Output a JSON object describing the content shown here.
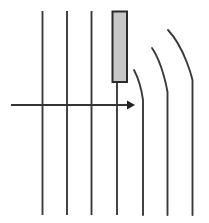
{
  "figure": {
    "title": "",
    "background_color": "#ffffff",
    "width": 209,
    "height": 223
  },
  "colors": {
    "line_stroke": "#3a3a3a",
    "curve_stroke": "#3a3a3a",
    "arrow_stroke": "#333333",
    "arrow_head_fill": "#222222",
    "slab_fill": "#c8c8c8",
    "slab_stroke": "#2b2b2b"
  },
  "chart_data": {
    "type": "line",
    "title": "",
    "xlabel": "",
    "ylabel": "",
    "grid": false,
    "legend": "none",
    "xlim": [
      0,
      209
    ],
    "ylim": [
      0,
      223
    ],
    "series": [
      {
        "name": "straight-line-1",
        "kind": "straight-vertical",
        "x": [
          42.5,
          42.5
        ],
        "y": [
          11,
          215
        ]
      },
      {
        "name": "straight-line-2",
        "kind": "straight-vertical",
        "x": [
          67.0,
          67.0
        ],
        "y": [
          11,
          215
        ]
      },
      {
        "name": "straight-line-3",
        "kind": "straight-vertical",
        "x": [
          91.5,
          91.5
        ],
        "y": [
          11,
          215
        ]
      },
      {
        "name": "straight-line-4",
        "kind": "straight-vertical",
        "x": [
          117.0,
          117.0
        ],
        "y": [
          82,
          215
        ]
      },
      {
        "name": "curved-line-1",
        "kind": "curve-bend-left-top",
        "path_points": [
          [
            134.0,
            70.0
          ],
          [
            140.5,
            82.0
          ],
          [
            143.0,
            100.0
          ],
          [
            143.0,
            215.0
          ]
        ]
      },
      {
        "name": "curved-line-2",
        "kind": "curve-bend-left-top",
        "path_points": [
          [
            152.0,
            48.0
          ],
          [
            163.0,
            64.0
          ],
          [
            167.5,
            92.0
          ],
          [
            167.5,
            215.0
          ]
        ]
      },
      {
        "name": "curved-line-3",
        "kind": "curve-bend-left-top",
        "path_points": [
          [
            168.0,
            30.0
          ],
          [
            185.0,
            48.0
          ],
          [
            192.5,
            80.0
          ],
          [
            192.5,
            215.0
          ]
        ]
      }
    ],
    "annotations": [
      {
        "name": "horizontal-arrow",
        "kind": "arrow",
        "from": [
          11,
          105
        ],
        "to": [
          135,
          105
        ],
        "direction": "right"
      },
      {
        "name": "gray-slab",
        "kind": "rectangle",
        "x": 112.0,
        "y": 11.0,
        "width": 15.0,
        "height": 71.0,
        "fill": "#c8c8c8"
      }
    ]
  }
}
